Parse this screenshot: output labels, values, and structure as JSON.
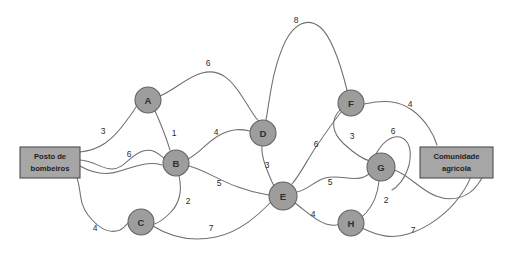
{
  "diagram": {
    "background_color": "#ffffff",
    "node_fill_color": "#9d9d9d",
    "node_stroke_color": "#636363",
    "edge_color": "#6f6f6f",
    "terminal_fill_color": "#a6a6a6",
    "terminal_stroke_color": "#4d4d4d",
    "label_color": "#2b2b2b"
  },
  "terminals": [
    {
      "id": "start",
      "name": "fire-station-box",
      "line1": "Posto de",
      "line2": "bombeiros",
      "x": 20,
      "y": 147,
      "w": 60,
      "h": 31
    },
    {
      "id": "end",
      "name": "agricultural-community-box",
      "line1": "Comunidade",
      "line2": "agrícola",
      "x": 420,
      "y": 147,
      "w": 73,
      "h": 31
    }
  ],
  "nodes": [
    {
      "id": "A",
      "label": "A",
      "x": 148,
      "y": 100,
      "r": 13
    },
    {
      "id": "B",
      "label": "B",
      "x": 176,
      "y": 163,
      "r": 13
    },
    {
      "id": "C",
      "label": "C",
      "x": 141,
      "y": 222,
      "r": 13
    },
    {
      "id": "D",
      "label": "D",
      "x": 263,
      "y": 133,
      "r": 13
    },
    {
      "id": "E",
      "label": "E",
      "x": 283,
      "y": 196,
      "r": 14
    },
    {
      "id": "F",
      "label": "F",
      "x": 351,
      "y": 103,
      "r": 13
    },
    {
      "id": "G",
      "label": "G",
      "x": 381,
      "y": 167,
      "r": 14
    },
    {
      "id": "H",
      "label": "H",
      "x": 351,
      "y": 223,
      "r": 13
    }
  ],
  "edges": [
    {
      "id": "start-A",
      "from": "start",
      "to": "A",
      "weight": "3",
      "label_x": 103,
      "label_y": 131,
      "path": "M 80 152 C 100 150, 112 140, 124 124 C 132 113, 138 106, 137 104"
    },
    {
      "id": "start-B",
      "from": "start",
      "to": "B",
      "weight": "6",
      "label_x": 129,
      "label_y": 154,
      "path": "M 80 160 C 94 161, 102 169, 112 169 C 124 169, 130 155, 143 151 C 154 148, 160 155, 165 159"
    },
    {
      "id": "start-C",
      "from": "start",
      "to": "C",
      "weight": "4",
      "label_x": 95,
      "label_y": 228,
      "path": "M 76 175 C 82 190, 78 202, 88 215 C 99 229, 110 234, 120 230 C 124 228, 127 224, 129 222"
    },
    {
      "id": "A-B",
      "from": "A",
      "to": "B",
      "weight": "1",
      "label_x": 174,
      "label_y": 133,
      "path": "M 155 111 C 160 122, 166 137, 170 150"
    },
    {
      "id": "A-D",
      "from": "A",
      "to": "D",
      "weight": "6",
      "label_x": 208,
      "label_y": 63,
      "path": "M 160 96 C 176 89, 187 77, 202 73 C 220 68, 232 80, 243 98 C 251 110, 256 120, 259 121"
    },
    {
      "id": "B-D",
      "from": "B",
      "to": "D",
      "weight": "4",
      "label_x": 216,
      "label_y": 132,
      "path": "M 188 159 C 200 153, 206 143, 218 136 C 232 128, 241 129, 250 131"
    },
    {
      "id": "B-C",
      "from": "B",
      "to": "C",
      "weight": "2",
      "label_x": 188,
      "label_y": 201,
      "path": "M 179 176 C 182 189, 180 203, 170 213 C 160 223, 153 225, 152 224"
    },
    {
      "id": "B-E",
      "from": "B",
      "to": "E",
      "weight": "5",
      "label_x": 219,
      "label_y": 183,
      "path": "M 189 166 C 205 170, 220 181, 238 187 C 254 193, 265 194, 269 195"
    },
    {
      "id": "C-E",
      "from": "C",
      "to": "E",
      "weight": "7",
      "label_x": 211,
      "label_y": 228,
      "path": "M 153 226 C 172 238, 192 242, 216 237 C 240 232, 258 215, 270 203"
    },
    {
      "id": "D-E",
      "from": "D",
      "to": "E",
      "weight": "3",
      "label_x": 267,
      "label_y": 165,
      "path": "M 262 146 C 261 156, 266 168, 272 182 C 275 188, 277 191, 278 183"
    },
    {
      "id": "D-F",
      "from": "D",
      "to": "F",
      "weight": "8",
      "label_x": 296,
      "label_y": 20,
      "path": "M 266 120 C 270 98, 272 70, 285 42 C 294 24, 307 17, 320 27 C 333 38, 342 70, 347 90"
    },
    {
      "id": "E-F",
      "from": "E",
      "to": "F",
      "weight": "6",
      "label_x": 316,
      "label_y": 144,
      "path": "M 292 184 C 302 172, 308 158, 318 144 C 329 128, 339 114, 343 110"
    },
    {
      "id": "E-G",
      "from": "E",
      "to": "G",
      "weight": "5",
      "label_x": 330,
      "label_y": 182,
      "path": "M 297 192 C 308 190, 314 181, 325 178 C 340 174, 352 182, 364 177 C 369 175, 371 172, 372 171"
    },
    {
      "id": "E-H",
      "from": "E",
      "to": "H",
      "weight": "4",
      "label_x": 313,
      "label_y": 214,
      "path": "M 295 203 C 306 211, 314 220, 326 224 C 334 226, 338 225, 339 224"
    },
    {
      "id": "F-G",
      "from": "F",
      "to": "G",
      "weight": "3",
      "label_x": 352,
      "label_y": 136,
      "path": "M 340 110 C 330 120, 332 133, 344 144 C 356 155, 366 160, 370 161"
    },
    {
      "id": "F-end",
      "from": "F",
      "to": "end",
      "weight": "4",
      "label_x": 410,
      "label_y": 104,
      "path": "M 364 104 C 384 100, 398 100, 412 110 C 426 120, 434 135, 437 145"
    },
    {
      "id": "G-end-top",
      "from": "G",
      "to": "end",
      "weight": "6",
      "label_x": 393,
      "label_y": 131,
      "path": "M 376 154 C 382 143, 391 135, 400 137 C 410 140, 412 152, 409 165 C 405 180, 396 188, 392 190"
    },
    {
      "id": "G-H",
      "from": "G",
      "to": "H",
      "weight": "2",
      "label_x": 386,
      "label_y": 200,
      "path": "M 379 181 C 378 192, 374 204, 366 213 C 360 219, 355 221, 354 221"
    },
    {
      "id": "H-end",
      "from": "H",
      "to": "end",
      "weight": "7",
      "label_x": 413,
      "label_y": 230,
      "path": "M 362 228 C 378 236, 392 239, 408 234 C 428 228, 448 213, 460 196 C 470 182, 472 174, 470 175"
    },
    {
      "id": "G-end-lower",
      "from": "G",
      "to": "end",
      "weight": "",
      "label_x": 0,
      "label_y": 0,
      "path": "M 394 170 C 408 174, 420 190, 436 196 C 454 203, 470 196, 478 184 C 484 176, 484 173, 483 175"
    },
    {
      "id": "start-lower-branch",
      "from": "start",
      "to": "B",
      "weight": "",
      "label_x": 0,
      "label_y": 0,
      "path": "M 80 166 C 94 174, 106 176, 120 171 C 136 166, 148 161, 162 165"
    }
  ]
}
